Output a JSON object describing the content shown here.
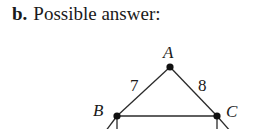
{
  "header": {
    "part_label": "b.",
    "title": "Possible answer:"
  },
  "graph": {
    "vertices": [
      {
        "id": "A",
        "label": "A",
        "x": 170,
        "y": 67,
        "label_x": 163,
        "label_y": 58
      },
      {
        "id": "B",
        "label": "B",
        "x": 117,
        "y": 116,
        "label_x": 93,
        "label_y": 116
      },
      {
        "id": "C",
        "label": "C",
        "x": 217,
        "y": 116,
        "label_x": 226,
        "label_y": 117
      }
    ],
    "edges": [
      {
        "from": "A",
        "to": "B",
        "weight": "7",
        "label_x": 130,
        "label_y": 91
      },
      {
        "from": "A",
        "to": "C",
        "weight": "8",
        "label_x": 198,
        "label_y": 91
      },
      {
        "from": "B",
        "to": "C",
        "weight": "6",
        "label_x": 163,
        "label_y": 140
      },
      {
        "from": "B",
        "to": "below-left",
        "weight": "2",
        "label_x": 75,
        "label_y": 140
      },
      {
        "from": "B",
        "to": "below",
        "weight": "",
        "label_x": 0,
        "label_y": 0
      },
      {
        "from": "C",
        "to": "below",
        "weight": "",
        "label_x": 0,
        "label_y": 0
      },
      {
        "from": "C",
        "to": "below-right",
        "weight": "6",
        "label_x": 249,
        "label_y": 140
      }
    ],
    "colors": {
      "line": "#2a2a2a",
      "vertex": "#111111",
      "text": "#1a1a1a"
    }
  }
}
